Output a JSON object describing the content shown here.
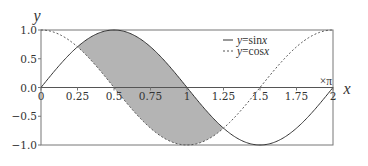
{
  "chart_data": {
    "type": "line",
    "title": "",
    "xlabel": "x",
    "ylabel": "y",
    "x_unit_label": "×π",
    "xlim": [
      0,
      2
    ],
    "ylim": [
      -1.0,
      1.0
    ],
    "x_ticks": [
      "0",
      "0.25",
      "0.5",
      "0.75",
      "1",
      "1.25",
      "1.5",
      "1.75",
      "2"
    ],
    "y_ticks": [
      "1.0",
      "0.5",
      "0.0",
      "−0.5",
      "−1.0"
    ],
    "grid": false,
    "legend_position": "upper right",
    "series": [
      {
        "name": "y=sin x",
        "label_y": "y",
        "label_fn": "=sin",
        "label_x": "x",
        "style": "solid",
        "color": "#333333",
        "x": [
          0,
          0.25,
          0.5,
          0.75,
          1,
          1.25,
          1.5,
          1.75,
          2
        ],
        "values": [
          0,
          0.707,
          1,
          0.707,
          0,
          -0.707,
          -1,
          -0.707,
          0
        ]
      },
      {
        "name": "y=cos x",
        "label_y": "y",
        "label_fn": "=cos",
        "label_x": "x",
        "style": "dashed",
        "color": "#555555",
        "x": [
          0,
          0.25,
          0.5,
          0.75,
          1,
          1.25,
          1.5,
          1.75,
          2
        ],
        "values": [
          1,
          0.707,
          0,
          -0.707,
          -1,
          -0.707,
          0,
          0.707,
          1
        ]
      }
    ],
    "annotations": [
      {
        "type": "shaded_region",
        "between": [
          "sin x",
          "cos x"
        ],
        "x_range": [
          0.25,
          1.25
        ],
        "color": "#b4b4b4"
      }
    ]
  }
}
